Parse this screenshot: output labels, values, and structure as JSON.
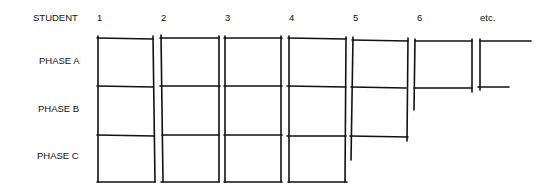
{
  "diagram": {
    "row_header": "STUDENT",
    "columns": [
      "1",
      "2",
      "3",
      "4",
      "5",
      "6",
      "etc."
    ],
    "rows": [
      "PHASE A",
      "PHASE B",
      "PHASE C"
    ],
    "colors": {
      "ink": "#111111",
      "background": "#ffffff"
    }
  }
}
